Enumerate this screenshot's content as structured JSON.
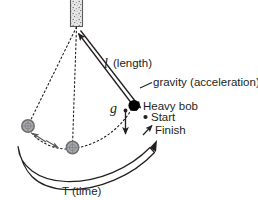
{
  "figure": {
    "type": "pendulum-diagram",
    "background_color": "#ffffff",
    "ink_color": "#231f20",
    "ghost_fill": "#a7a9ac",
    "ghost_stroke": "#6d6e71"
  },
  "labels": {
    "length_symbol": "l",
    "length_text": "(length)",
    "gravity_text": "gravity (acceleration)",
    "gravity_symbol": "g",
    "heavy_bob": "Heavy bob",
    "start": "Start",
    "finish": "Finish",
    "period_text": "T (time)"
  },
  "parts": {
    "mount": "ceiling-mount-block",
    "pivot": "pivot-point",
    "bob": "heavy-bob-filled-circle",
    "ghost_bob_left": "bob-position-left",
    "ghost_bob_bottom": "bob-position-bottom",
    "string_dashed": "dashed-string-paths",
    "length_arrow": "double-headed-length-arrow",
    "gravity_arrow": "downward-gravity-arrow",
    "swing_arrow": "swing-direction-double-arrow",
    "period_arc": "period-crescent-arc",
    "gravity_leader": "gravity-leader-line",
    "start_marker": "start-dot",
    "finish_marker": "finish-arrow"
  }
}
